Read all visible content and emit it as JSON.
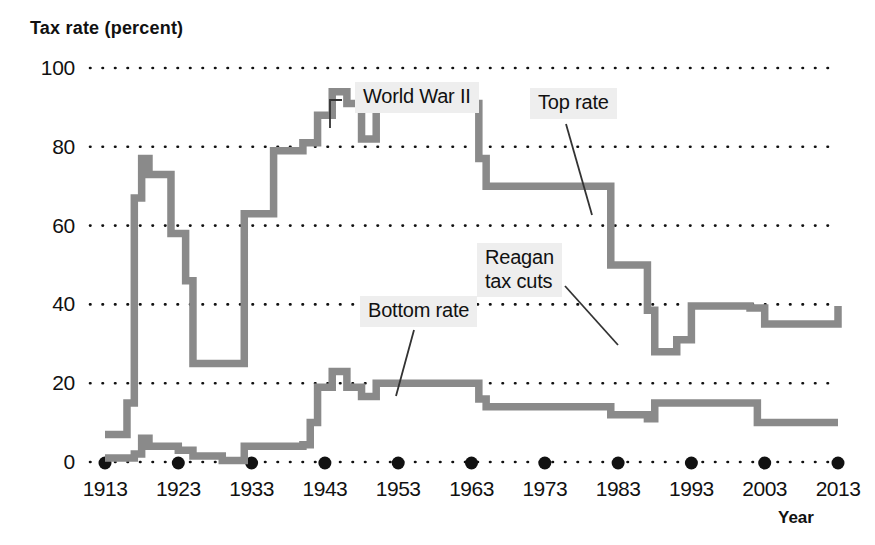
{
  "chart_data": {
    "type": "line",
    "title": "",
    "subtitle": "",
    "xlabel": "Year",
    "ylabel": "Tax rate (percent)",
    "xlim": [
      1913,
      2013
    ],
    "ylim": [
      0,
      100
    ],
    "grid": true,
    "grid_style": "dotted-horizontal",
    "legend_position": "inline-annotations",
    "x_ticks": [
      1913,
      1923,
      1933,
      1943,
      1953,
      1963,
      1973,
      1983,
      1993,
      2003,
      2013
    ],
    "x_tick_labels": [
      "1913",
      "1923",
      "1933",
      "1943",
      "1953",
      "1963",
      "1973",
      "1983",
      "1993",
      "2003",
      "2013"
    ],
    "y_ticks": [
      0,
      20,
      40,
      60,
      80,
      100
    ],
    "y_tick_labels": [
      "0",
      "20",
      "40",
      "60",
      "80",
      "100"
    ],
    "line_color": "#8a8a8a",
    "series": [
      {
        "name": "Top rate",
        "step": "post",
        "points": [
          [
            1913,
            7
          ],
          [
            1916,
            15
          ],
          [
            1917,
            67
          ],
          [
            1918,
            77
          ],
          [
            1919,
            73
          ],
          [
            1922,
            58
          ],
          [
            1924,
            46
          ],
          [
            1925,
            25
          ],
          [
            1932,
            63
          ],
          [
            1936,
            79
          ],
          [
            1938,
            79
          ],
          [
            1940,
            81
          ],
          [
            1941,
            81
          ],
          [
            1942,
            88
          ],
          [
            1944,
            94
          ],
          [
            1946,
            91
          ],
          [
            1948,
            82
          ],
          [
            1950,
            91
          ],
          [
            1964,
            77
          ],
          [
            1965,
            70
          ],
          [
            1982,
            50
          ],
          [
            1987,
            38.5
          ],
          [
            1988,
            28
          ],
          [
            1991,
            31
          ],
          [
            1993,
            39.6
          ],
          [
            2001,
            39.1
          ],
          [
            2003,
            35
          ],
          [
            2013,
            39.6
          ]
        ]
      },
      {
        "name": "Bottom rate",
        "step": "post",
        "points": [
          [
            1913,
            1
          ],
          [
            1917,
            2
          ],
          [
            1918,
            6
          ],
          [
            1919,
            4
          ],
          [
            1923,
            3
          ],
          [
            1925,
            1.5
          ],
          [
            1929,
            0.4
          ],
          [
            1932,
            4
          ],
          [
            1936,
            4
          ],
          [
            1940,
            4.4
          ],
          [
            1941,
            10
          ],
          [
            1942,
            19
          ],
          [
            1944,
            23
          ],
          [
            1946,
            19
          ],
          [
            1948,
            16.6
          ],
          [
            1950,
            20
          ],
          [
            1954,
            20
          ],
          [
            1964,
            16
          ],
          [
            1965,
            14
          ],
          [
            1977,
            14
          ],
          [
            1979,
            14
          ],
          [
            1982,
            12
          ],
          [
            1987,
            11
          ],
          [
            1988,
            15
          ],
          [
            1991,
            15
          ],
          [
            1993,
            15
          ],
          [
            2001,
            15
          ],
          [
            2002,
            10
          ],
          [
            2013,
            10
          ]
        ]
      }
    ],
    "annotations": [
      {
        "label": "World War II",
        "target_series": "Top rate",
        "target_year": 1944,
        "target_value": 94
      },
      {
        "label": "Top rate",
        "target_series": "Top rate",
        "target_year": 1979,
        "target_value": 70
      },
      {
        "label": "Reagan\ntax cuts",
        "target_series": "Top rate",
        "target_year": 1988,
        "target_value": 28
      },
      {
        "label": "Bottom rate",
        "target_series": "Bottom rate",
        "target_year": 1958,
        "target_value": 20
      }
    ]
  }
}
